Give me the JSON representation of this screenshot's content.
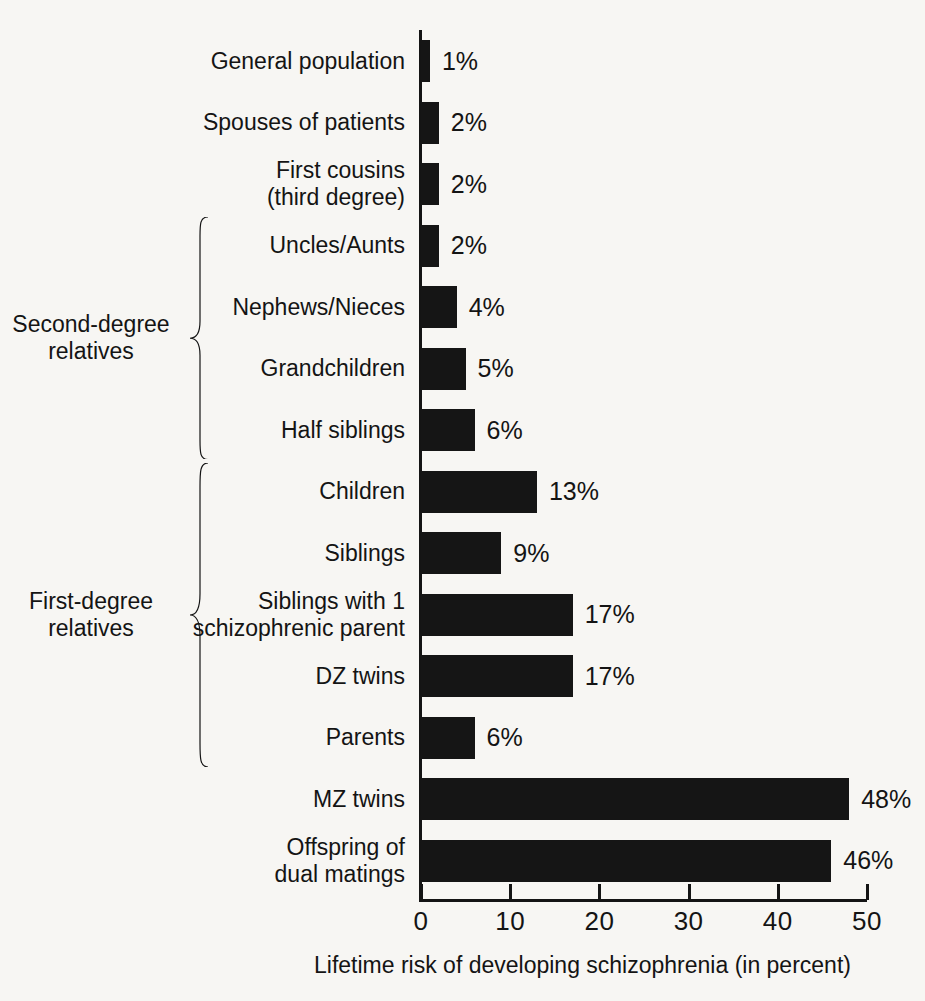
{
  "chart_data": {
    "type": "bar",
    "orientation": "horizontal",
    "title": "",
    "subtitle": "",
    "xlabel": "Lifetime risk of developing schizophrenia (in percent)",
    "ylabel": "",
    "xlim": [
      0,
      50
    ],
    "xticks": [
      0,
      10,
      20,
      30,
      40,
      50
    ],
    "xtick_labels": [
      "0",
      "10",
      "20",
      "30",
      "40",
      "50"
    ],
    "grid": false,
    "legend": null,
    "bar_color": "#151515",
    "background_color": "#f7f6f3",
    "categories": [
      "General population",
      "Spouses of patients",
      "First cousins\n(third degree)",
      "Uncles/Aunts",
      "Nephews/Nieces",
      "Grandchildren",
      "Half siblings",
      "Children",
      "Siblings",
      "Siblings with 1\nschizophrenic parent",
      "DZ twins",
      "Parents",
      "MZ twins",
      "Offspring of\ndual matings"
    ],
    "values": [
      1,
      2,
      2,
      2,
      4,
      5,
      6,
      13,
      9,
      17,
      17,
      6,
      48,
      46
    ],
    "value_labels": [
      "1%",
      "2%",
      "2%",
      "2%",
      "4%",
      "5%",
      "6%",
      "13%",
      "9%",
      "17%",
      "17%",
      "6%",
      "48%",
      "46%"
    ],
    "annotations": [
      {
        "label": "Second-degree\nrelatives",
        "covers": [
          "Uncles/Aunts",
          "Nephews/Nieces",
          "Grandchildren",
          "Half siblings"
        ]
      },
      {
        "label": "First-degree\nrelatives",
        "covers": [
          "Children",
          "Siblings",
          "Siblings with 1 schizophrenic parent",
          "DZ twins",
          "Parents"
        ]
      }
    ]
  },
  "groups": {
    "second_degree": "Second-degree\nrelatives",
    "first_degree": "First-degree\nrelatives"
  }
}
